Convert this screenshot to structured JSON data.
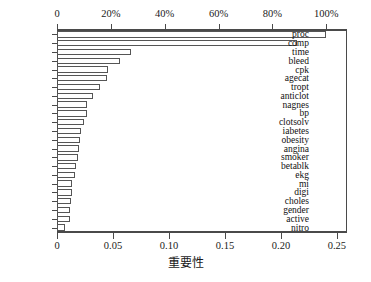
{
  "chart_data": {
    "type": "bar",
    "orientation": "horizontal",
    "title": "",
    "xlabel": "重要性",
    "ylabel": "",
    "xlim": [
      0,
      0.259
    ],
    "grid": false,
    "legend": null,
    "categories": [
      "proc",
      "comp",
      "time",
      "bleed",
      "cpk",
      "agecat",
      "tropt",
      "anticlot",
      "nagnes",
      "bp",
      "clotsolv",
      "iabetes",
      "obesity",
      "angina",
      "smoker",
      "betablk",
      "ekg",
      "mi",
      "digi",
      "choles",
      "gender",
      "active",
      "nitro"
    ],
    "values": [
      0.2405,
      0.214,
      0.0662,
      0.0567,
      0.0458,
      0.0447,
      0.0383,
      0.0322,
      0.0272,
      0.0268,
      0.024,
      0.0218,
      0.0203,
      0.02,
      0.0192,
      0.0167,
      0.0163,
      0.0137,
      0.0133,
      0.0128,
      0.012,
      0.0117,
      0.0072
    ],
    "bottom_axis": {
      "label": "重要性",
      "ticks": [
        0,
        0.05,
        0.1,
        0.15,
        0.2,
        0.25
      ],
      "tick_labels": [
        "0",
        "0.05",
        "0.10",
        "0.15",
        "0.20",
        "0.25"
      ]
    },
    "top_axis": {
      "label": "",
      "ticks": [
        0,
        0.2,
        0.4,
        0.6,
        0.8,
        1.0
      ],
      "tick_labels": [
        "0",
        "20%",
        "40%",
        "60%",
        "80%",
        "100%"
      ],
      "scale_note": "percent of maximum importance",
      "max_value": 0.2405
    },
    "colors": {
      "bar_fill": "#ffffff",
      "bar_stroke": "#555555",
      "axis": "#4a4a4a",
      "text": "#111111",
      "background": "#ffffff"
    }
  }
}
